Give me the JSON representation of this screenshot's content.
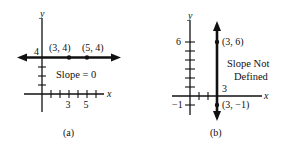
{
  "panels": [
    {
      "id": "a",
      "caption": "(a)",
      "x_axis_label": "x",
      "y_axis_label": "y",
      "line": {
        "type": "horizontal",
        "value": 4
      },
      "y_intercept_label": "4",
      "x_tick_labels": [
        "3",
        "5"
      ],
      "points": [
        {
          "x": 3,
          "y": 4,
          "label": "(3, 4)"
        },
        {
          "x": 5,
          "y": 4,
          "label": "(5, 4)"
        }
      ],
      "annotation": "Slope = 0"
    },
    {
      "id": "b",
      "caption": "(b)",
      "x_axis_label": "x",
      "y_axis_label": "y",
      "line": {
        "type": "vertical",
        "value": 3
      },
      "x_intercept_label": "3",
      "y_tick_labels": [
        "6",
        "−1"
      ],
      "points": [
        {
          "x": 3,
          "y": 6,
          "label": "(3, 6)"
        },
        {
          "x": 3,
          "y": -1,
          "label": "(3, −1)"
        }
      ],
      "annotation_lines": [
        "Slope Not",
        "Defined"
      ]
    }
  ]
}
